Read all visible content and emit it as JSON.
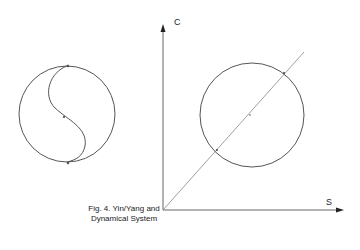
{
  "figure": {
    "caption_line1": "Fig. 4. Yin/Yang and",
    "caption_line2": "Dynamical System",
    "colors": {
      "stroke": "#555555",
      "text": "#222222",
      "background": "#ffffff"
    }
  },
  "left_diagram": {
    "type": "yin-yang circle",
    "center": [
      67,
      114
    ],
    "radius": 49
  },
  "right_diagram": {
    "axis_y_label": "C",
    "axis_x_label": "S",
    "circle_center": [
      250,
      115
    ],
    "circle_radius": 52,
    "line": "diagonal from origin through circle"
  }
}
